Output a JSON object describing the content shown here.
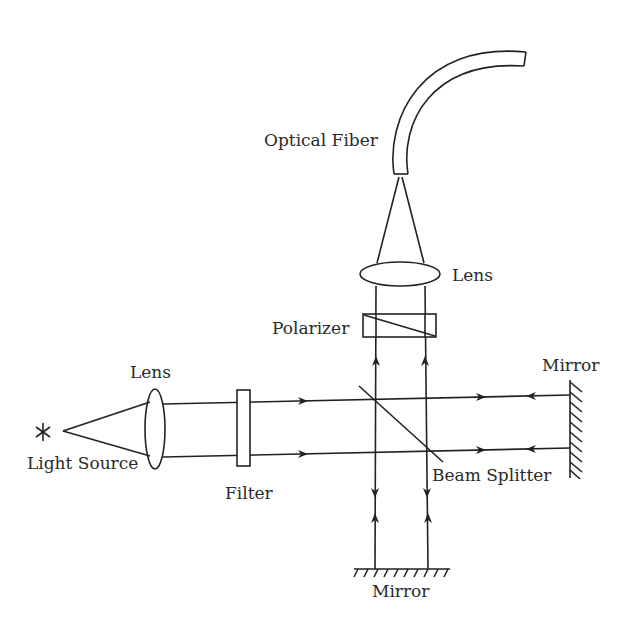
{
  "diagram": {
    "type": "optical-setup",
    "labels": {
      "optical_fiber": "Optical Fiber",
      "lens_top": "Lens",
      "polarizer": "Polarizer",
      "mirror_right": "Mirror",
      "lens_left": "Lens",
      "light_source": "Light Source",
      "filter": "Filter",
      "beam_splitter": "Beam Splitter",
      "mirror_bottom": "Mirror"
    },
    "components": [
      {
        "id": "light-source",
        "symbol": "asterisk"
      },
      {
        "id": "lens-left",
        "shape": "vertical-ellipse"
      },
      {
        "id": "filter",
        "shape": "rectangle"
      },
      {
        "id": "beam-splitter",
        "shape": "diagonal-line"
      },
      {
        "id": "mirror-right",
        "shape": "hatched-line"
      },
      {
        "id": "mirror-bottom",
        "shape": "hatched-line"
      },
      {
        "id": "polarizer",
        "shape": "rectangle-with-diagonal"
      },
      {
        "id": "lens-top",
        "shape": "horizontal-ellipse"
      },
      {
        "id": "optical-fiber",
        "shape": "curved-tube"
      }
    ],
    "stroke_color": "#222222"
  }
}
